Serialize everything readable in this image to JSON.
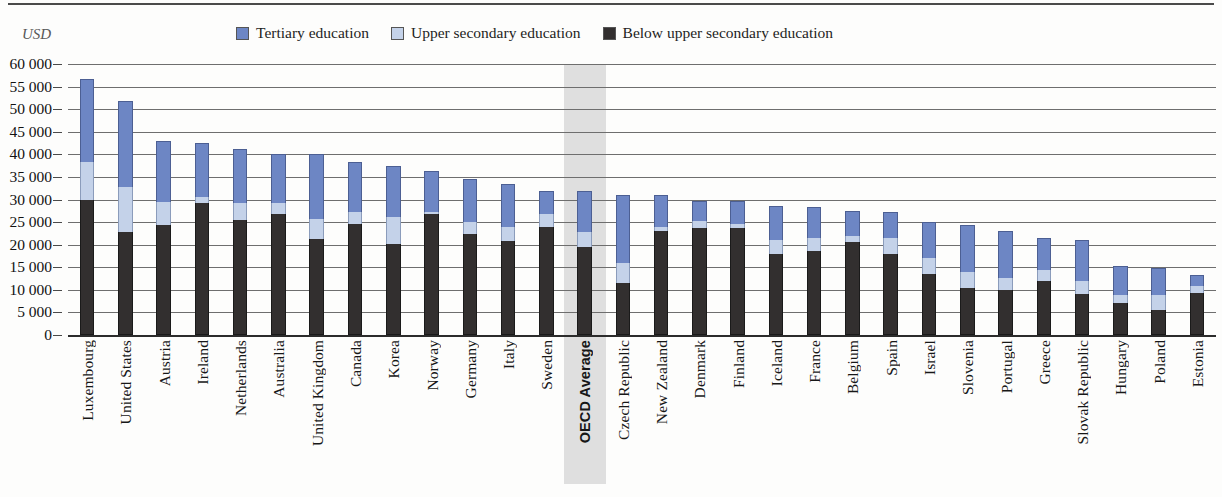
{
  "unit_label": "USD",
  "legend": {
    "items": [
      {
        "label": "Tertiary education",
        "key": "tertiary",
        "color": "#6d86c4",
        "icon": "square-swatch-icon"
      },
      {
        "label": "Upper secondary education",
        "key": "upper_secondary",
        "color": "#c4d2e9",
        "icon": "square-swatch-icon"
      },
      {
        "label": "Below upper secondary education",
        "key": "below_upper_secondary",
        "color": "#322f2f",
        "icon": "square-swatch-icon"
      }
    ]
  },
  "y_axis": {
    "tick_labels": [
      "60 000",
      "55 000",
      "50 000",
      "45 000",
      "40 000",
      "35 000",
      "30 000",
      "25 000",
      "20 000",
      "15 000",
      "10 000",
      "5 000",
      "0"
    ],
    "tick_values": [
      60000,
      55000,
      50000,
      45000,
      40000,
      35000,
      30000,
      25000,
      20000,
      15000,
      10000,
      5000,
      0
    ],
    "min": 0,
    "max": 60000,
    "step": 5000
  },
  "highlight": {
    "category": "OECD Average",
    "color": "#dcdcdc"
  },
  "chart_data": {
    "type": "bar",
    "stacked": true,
    "title": "",
    "subtitle": "",
    "xlabel": "",
    "ylabel": "USD",
    "ylim": [
      0,
      60000
    ],
    "grid": true,
    "legend_position": "top",
    "categories": [
      "Luxembourg",
      "United States",
      "Austria",
      "Ireland",
      "Netherlands",
      "Australia",
      "United Kingdom",
      "Canada",
      "Korea",
      "Norway",
      "Germany",
      "Italy",
      "Sweden",
      "OECD Average",
      "Czech Republic",
      "New Zealand",
      "Denmark",
      "Finland",
      "Iceland",
      "France",
      "Belgium",
      "Spain",
      "Israel",
      "Slovenia",
      "Portugal",
      "Greece",
      "Slovak Republic",
      "Hungary",
      "Poland",
      "Estonia"
    ],
    "series": [
      {
        "name": "Below upper secondary education",
        "color": "#322f2f",
        "values": [
          29800,
          22800,
          24300,
          29300,
          25500,
          26800,
          21200,
          24600,
          20100,
          26800,
          22400,
          20800,
          24000,
          19500,
          11600,
          23000,
          23700,
          23700,
          18000,
          18500,
          20600,
          18000,
          13500,
          10500,
          10000,
          12000,
          9000,
          7000,
          5600,
          9200
        ]
      },
      {
        "name": "Upper secondary education",
        "color": "#c4d2e9",
        "values": [
          8500,
          10000,
          5200,
          1200,
          3700,
          2500,
          4500,
          2600,
          6000,
          500,
          2700,
          3200,
          2700,
          3300,
          4400,
          1000,
          1500,
          900,
          3000,
          3000,
          1400,
          3500,
          3500,
          3400,
          2700,
          2500,
          3000,
          1900,
          3200,
          1700
        ]
      },
      {
        "name": "Tertiary education",
        "color": "#6d86c4",
        "values": [
          18300,
          19000,
          13500,
          12000,
          12000,
          10800,
          14300,
          11200,
          11400,
          9000,
          9500,
          9500,
          5200,
          9000,
          14900,
          7000,
          4400,
          5000,
          7600,
          6900,
          5400,
          5800,
          8000,
          10500,
          10300,
          7000,
          9000,
          6400,
          6000,
          2400
        ]
      }
    ]
  }
}
